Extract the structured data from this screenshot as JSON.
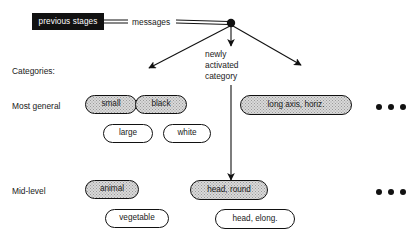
{
  "diagram": {
    "background_color": "#ffffff",
    "ink_color": "#111111",
    "shaded_fill_color": "#d9d9d9"
  },
  "source": {
    "label": "previous stages",
    "box_fill": "#111111",
    "text_color": "#ffffff"
  },
  "edges": {
    "messages_label": "messages",
    "junction_name": "message-junction-node"
  },
  "annotations": {
    "center": {
      "line1": "newly",
      "line2": "activated",
      "line3": "category"
    }
  },
  "rows": {
    "header_label": "Categories:",
    "most_general_label": "Most general",
    "mid_level_label": "Mid-level"
  },
  "nodes": {
    "most_general": [
      {
        "id": "small",
        "label": "small",
        "shaded": true
      },
      {
        "id": "black",
        "label": "black",
        "shaded": true
      },
      {
        "id": "large",
        "label": "large",
        "shaded": false
      },
      {
        "id": "white",
        "label": "white",
        "shaded": false
      },
      {
        "id": "long-axis-horiz",
        "label": "long axis, horiz.",
        "shaded": true
      }
    ],
    "mid_level": [
      {
        "id": "animal",
        "label": "animal",
        "shaded": true
      },
      {
        "id": "vegetable",
        "label": "vegetable",
        "shaded": false
      },
      {
        "id": "head-round",
        "label": "head, round",
        "shaded": true
      },
      {
        "id": "head-elong",
        "label": "head, elong.",
        "shaded": false
      }
    ]
  },
  "ellipsis": {
    "glyph": "•••",
    "dot_count": 3
  }
}
